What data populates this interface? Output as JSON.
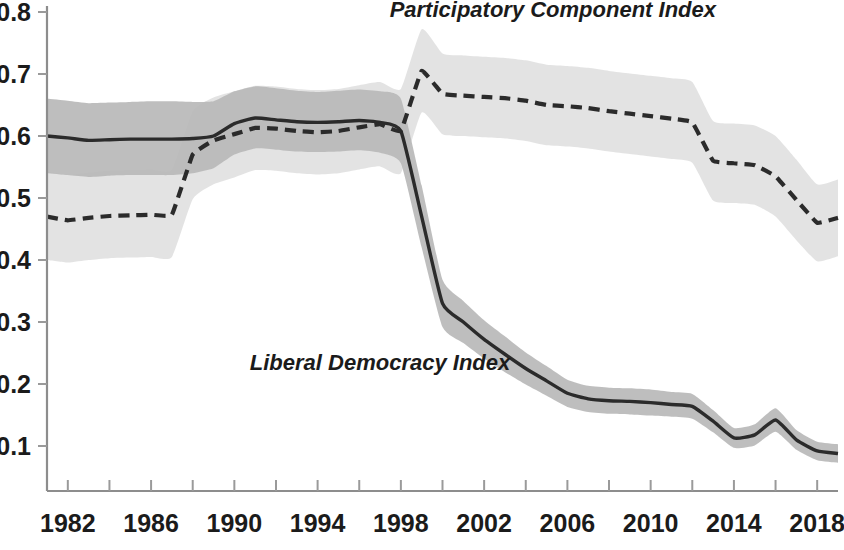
{
  "chart_data": {
    "type": "line",
    "title": "",
    "subtitle": "",
    "xlabel": "",
    "ylabel": "",
    "xlim": [
      1981,
      2019
    ],
    "ylim": [
      0.0,
      0.8
    ],
    "yticks": [
      "0.1",
      "0.2",
      "0.3",
      "0.4",
      "0.5",
      "0.6",
      "0.7",
      "0.8"
    ],
    "ytick_values": [
      0.1,
      0.2,
      0.3,
      0.4,
      0.5,
      0.6,
      0.7,
      0.8
    ],
    "xticks": [
      "1982",
      "1986",
      "1990",
      "1994",
      "1998",
      "2002",
      "2006",
      "2010",
      "2014",
      "2018"
    ],
    "xtick_values": [
      1982,
      1986,
      1990,
      1994,
      1998,
      2002,
      2006,
      2010,
      2014,
      2018
    ],
    "xminor_values": [
      1984,
      1988,
      1992,
      1996,
      2000,
      2004,
      2008,
      2012,
      2016
    ],
    "grid": false,
    "legend_position": "inline-annotations",
    "x": [
      1981,
      1982,
      1983,
      1984,
      1985,
      1986,
      1987,
      1988,
      1989,
      1990,
      1991,
      1992,
      1993,
      1994,
      1995,
      1996,
      1997,
      1998,
      1999,
      2000,
      2001,
      2002,
      2003,
      2004,
      2005,
      2006,
      2007,
      2008,
      2009,
      2010,
      2011,
      2012,
      2013,
      2014,
      2015,
      2016,
      2017,
      2018,
      2019
    ],
    "series": [
      {
        "name": "Liberal Democracy Index",
        "style": "solid",
        "color": "#2b2b2b",
        "band_color": "#b9b9b9",
        "values": [
          0.6,
          0.597,
          0.593,
          0.594,
          0.595,
          0.595,
          0.595,
          0.596,
          0.6,
          0.62,
          0.629,
          0.626,
          0.623,
          0.622,
          0.623,
          0.625,
          0.622,
          0.608,
          0.47,
          0.33,
          0.3,
          0.272,
          0.248,
          0.225,
          0.205,
          0.185,
          0.176,
          0.173,
          0.172,
          0.17,
          0.167,
          0.164,
          0.14,
          0.113,
          0.118,
          0.142,
          0.11,
          0.092,
          0.088
        ],
        "band_lower": [
          0.54,
          0.537,
          0.534,
          0.536,
          0.537,
          0.537,
          0.537,
          0.54,
          0.548,
          0.57,
          0.58,
          0.578,
          0.575,
          0.574,
          0.575,
          0.577,
          0.573,
          0.556,
          0.42,
          0.292,
          0.266,
          0.241,
          0.219,
          0.199,
          0.181,
          0.163,
          0.155,
          0.152,
          0.151,
          0.149,
          0.147,
          0.144,
          0.122,
          0.097,
          0.101,
          0.123,
          0.094,
          0.077,
          0.073
        ],
        "band_upper": [
          0.66,
          0.657,
          0.653,
          0.654,
          0.655,
          0.656,
          0.656,
          0.655,
          0.656,
          0.672,
          0.68,
          0.677,
          0.673,
          0.671,
          0.673,
          0.675,
          0.672,
          0.66,
          0.52,
          0.368,
          0.334,
          0.303,
          0.277,
          0.251,
          0.229,
          0.207,
          0.197,
          0.194,
          0.193,
          0.191,
          0.187,
          0.184,
          0.158,
          0.129,
          0.135,
          0.161,
          0.126,
          0.107,
          0.103
        ]
      },
      {
        "name": "Participatory Component Index",
        "style": "dashed",
        "color": "#2b2b2b",
        "band_color": "#e2e2e2",
        "values": [
          0.47,
          0.464,
          0.468,
          0.471,
          0.472,
          0.473,
          0.473,
          0.57,
          0.593,
          0.603,
          0.613,
          0.612,
          0.608,
          0.606,
          0.608,
          0.614,
          0.619,
          0.608,
          0.705,
          0.668,
          0.665,
          0.663,
          0.661,
          0.657,
          0.65,
          0.648,
          0.645,
          0.64,
          0.636,
          0.632,
          0.628,
          0.622,
          0.56,
          0.556,
          0.553,
          0.535,
          0.497,
          0.46,
          0.468
        ],
        "band_lower": [
          0.4,
          0.396,
          0.4,
          0.403,
          0.404,
          0.405,
          0.405,
          0.498,
          0.522,
          0.533,
          0.545,
          0.544,
          0.54,
          0.538,
          0.54,
          0.546,
          0.551,
          0.54,
          0.638,
          0.603,
          0.6,
          0.598,
          0.596,
          0.592,
          0.585,
          0.583,
          0.58,
          0.575,
          0.571,
          0.567,
          0.563,
          0.557,
          0.496,
          0.492,
          0.489,
          0.47,
          0.432,
          0.398,
          0.406
        ],
        "band_upper": [
          0.543,
          0.537,
          0.541,
          0.544,
          0.545,
          0.546,
          0.546,
          0.64,
          0.662,
          0.672,
          0.681,
          0.68,
          0.676,
          0.674,
          0.676,
          0.682,
          0.687,
          0.676,
          0.772,
          0.733,
          0.73,
          0.728,
          0.726,
          0.722,
          0.715,
          0.713,
          0.71,
          0.705,
          0.701,
          0.697,
          0.693,
          0.687,
          0.624,
          0.62,
          0.617,
          0.6,
          0.562,
          0.522,
          0.53
        ]
      }
    ],
    "annotations": [
      {
        "text": "Participatory Component Index",
        "x": 2005.3,
        "y": 0.792,
        "anchor": "middle"
      },
      {
        "text": "Liberal Democracy Index",
        "x": 1997.0,
        "y": 0.222,
        "anchor": "middle"
      }
    ]
  },
  "axes": {
    "y_axis_name": "value-axis",
    "x_axis_name": "year-axis"
  }
}
